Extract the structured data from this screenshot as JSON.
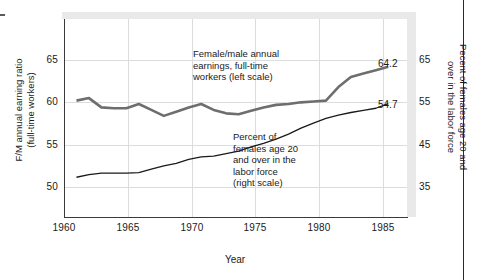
{
  "chart_data": {
    "type": "line",
    "title": "",
    "xlabel": "Year",
    "ylabel_left": "F/M annual earning ratio\n(full-time workers)",
    "ylabel_right": "Pecent of females age 20 and\nover in the labor force",
    "grid": true,
    "legend": "annotations-inline",
    "x": [
      1960,
      1961,
      1962,
      1963,
      1964,
      1965,
      1966,
      1967,
      1968,
      1969,
      1970,
      1971,
      1972,
      1973,
      1974,
      1975,
      1976,
      1977,
      1978,
      1979,
      1980,
      1981,
      1982,
      1983,
      1984,
      1985
    ],
    "xticks": [
      "1960",
      "1965",
      "1970",
      "1975",
      "1980",
      "1985"
    ],
    "xlim": [
      1959,
      1986.5
    ],
    "yticks_left": [
      "65",
      "60",
      "55",
      "50"
    ],
    "ylim_left": [
      45.0,
      67.5
    ],
    "yticks_right": [
      "65",
      "55",
      "45",
      "35"
    ],
    "ylim_right": [
      20.0,
      72.5
    ],
    "series": [
      {
        "name": "Female/male annual earnings, full-time workers (left scale)",
        "axis": "left",
        "color": "#6e6e6e",
        "width": 2.6,
        "end_label": "64.2",
        "values": [
          60.2,
          60.5,
          59.4,
          59.3,
          59.3,
          59.8,
          59.1,
          58.4,
          58.9,
          59.4,
          59.8,
          59.1,
          58.7,
          58.6,
          59.0,
          59.4,
          59.7,
          59.8,
          60.0,
          60.1,
          60.2,
          61.8,
          63.0,
          63.4,
          63.8,
          64.2
        ]
      },
      {
        "name": "Percent of females age 20 and over in the labor force (right scale)",
        "axis": "right",
        "color": "#1a1a1a",
        "width": 1.3,
        "end_label": "54.7",
        "values": [
          37.3,
          37.9,
          38.3,
          38.3,
          38.3,
          38.4,
          39.2,
          40.0,
          40.6,
          41.5,
          42.1,
          42.3,
          42.9,
          43.5,
          44.5,
          45.3,
          46.3,
          47.5,
          48.9,
          50.1,
          51.2,
          52.0,
          52.6,
          53.1,
          53.6,
          54.7
        ]
      }
    ]
  },
  "axis": {
    "x_title": "Year",
    "y_left_line1": "F/M annual earning ratio",
    "y_left_line2": "(full-time workers)",
    "y_right_line1": "Pecent of females age 20 and",
    "y_right_line2": "over in the labor force",
    "xticks": [
      "1960",
      "1965",
      "1970",
      "1975",
      "1980",
      "1985"
    ],
    "yticks_left": [
      "65",
      "60",
      "55",
      "50"
    ],
    "yticks_right": [
      "65",
      "55",
      "45",
      "35"
    ]
  },
  "annotations": {
    "upper": "Female/male annual\nearnings, full-time\nworkers (left scale)",
    "lower": "Percent of\nfemales age 20\nand over in the\nlabor force\n(right scale)",
    "end_upper": "64.2",
    "end_lower": "54.7"
  },
  "colors": {
    "series_upper": "#6e6e6e",
    "series_lower": "#1a1a1a",
    "grid": "#dcdcdc",
    "axis": "#3a3a3a",
    "shadow": "#e9e9e9"
  }
}
